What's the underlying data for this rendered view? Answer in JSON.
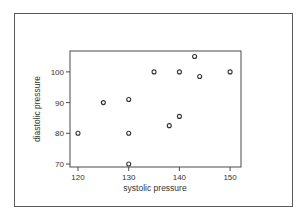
{
  "chart_data": {
    "type": "scatter",
    "title": "",
    "xlabel": "systolic pressure",
    "ylabel": "diastolic pressure",
    "xlim": [
      119,
      151
    ],
    "ylim": [
      69,
      107
    ],
    "xticks": [
      120,
      130,
      140,
      150
    ],
    "yticks": [
      70,
      80,
      90,
      100
    ],
    "grid": false,
    "legend": null,
    "marker": "open-circle",
    "points": [
      {
        "x": 120,
        "y": 80
      },
      {
        "x": 125,
        "y": 90
      },
      {
        "x": 130,
        "y": 91
      },
      {
        "x": 130,
        "y": 80
      },
      {
        "x": 130,
        "y": 70
      },
      {
        "x": 135,
        "y": 100
      },
      {
        "x": 138,
        "y": 82.5
      },
      {
        "x": 140,
        "y": 100
      },
      {
        "x": 140,
        "y": 85.5
      },
      {
        "x": 143,
        "y": 105
      },
      {
        "x": 144,
        "y": 98.5
      },
      {
        "x": 150,
        "y": 100
      }
    ]
  },
  "colors": {
    "axis": "#4a4a4a",
    "marker": "#333333",
    "frame": "#5a5a5a"
  }
}
